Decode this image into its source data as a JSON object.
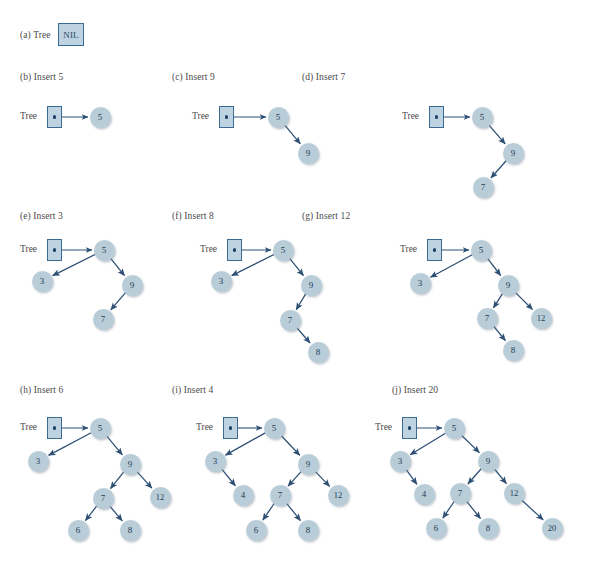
{
  "figure": {
    "node_fill": "#b9cdd9",
    "box_fill": "#bdd3e2",
    "border_color": "#3d6a91",
    "arrow_color": "#2d4f74",
    "text_color": "#243c52",
    "tree_pointer_label": "Tree",
    "nil_label": "NIL"
  },
  "panels": [
    {
      "id": "a",
      "label": "(a) Tree",
      "has_root_box": false,
      "has_nil": true,
      "nodes": [],
      "edges": []
    },
    {
      "id": "b",
      "label": "(b) Insert 5",
      "has_root_box": true,
      "has_nil": false,
      "nodes": [
        {
          "key": "5",
          "x": 100,
          "y": 117
        }
      ],
      "edges": [
        {
          "from": "root",
          "to": "5"
        }
      ]
    },
    {
      "id": "c",
      "label": "(c) Insert 9",
      "has_root_box": true,
      "has_nil": false,
      "nodes": [
        {
          "key": "5",
          "x": 278,
          "y": 117
        },
        {
          "key": "9",
          "x": 308,
          "y": 153
        }
      ],
      "edges": [
        {
          "from": "root",
          "to": "5"
        },
        {
          "from": "5",
          "to": "9"
        }
      ]
    },
    {
      "id": "d",
      "label": "(d) Insert 7",
      "has_root_box": true,
      "has_nil": false,
      "nodes": [
        {
          "key": "5",
          "x": 482,
          "y": 117
        },
        {
          "key": "9",
          "x": 513,
          "y": 153
        },
        {
          "key": "7",
          "x": 483,
          "y": 187
        }
      ],
      "edges": [
        {
          "from": "root",
          "to": "5"
        },
        {
          "from": "5",
          "to": "9"
        },
        {
          "from": "9",
          "to": "7"
        }
      ]
    },
    {
      "id": "e",
      "label": "(e) Insert 3",
      "has_root_box": true,
      "has_nil": false,
      "nodes": [
        {
          "key": "5",
          "x": 104,
          "y": 250
        },
        {
          "key": "3",
          "x": 42,
          "y": 281
        },
        {
          "key": "9",
          "x": 132,
          "y": 285
        },
        {
          "key": "7",
          "x": 103,
          "y": 319
        }
      ],
      "edges": [
        {
          "from": "root",
          "to": "5"
        },
        {
          "from": "5",
          "to": "3"
        },
        {
          "from": "5",
          "to": "9"
        },
        {
          "from": "9",
          "to": "7"
        }
      ]
    },
    {
      "id": "f",
      "label": "(f) Insert 8",
      "has_root_box": true,
      "has_nil": false,
      "nodes": [
        {
          "key": "5",
          "x": 283,
          "y": 250
        },
        {
          "key": "3",
          "x": 221,
          "y": 281
        },
        {
          "key": "9",
          "x": 311,
          "y": 285
        },
        {
          "key": "7",
          "x": 290,
          "y": 320
        },
        {
          "key": "8",
          "x": 318,
          "y": 352
        }
      ],
      "edges": [
        {
          "from": "root",
          "to": "5"
        },
        {
          "from": "5",
          "to": "3"
        },
        {
          "from": "5",
          "to": "9"
        },
        {
          "from": "9",
          "to": "7"
        },
        {
          "from": "7",
          "to": "8"
        }
      ]
    },
    {
      "id": "g",
      "label": "(g) Insert 12",
      "has_root_box": true,
      "has_nil": false,
      "nodes": [
        {
          "key": "5",
          "x": 481,
          "y": 250
        },
        {
          "key": "3",
          "x": 420,
          "y": 283
        },
        {
          "key": "9",
          "x": 508,
          "y": 285
        },
        {
          "key": "7",
          "x": 487,
          "y": 318
        },
        {
          "key": "12",
          "x": 541,
          "y": 318
        },
        {
          "key": "8",
          "x": 513,
          "y": 350
        }
      ],
      "edges": [
        {
          "from": "root",
          "to": "5"
        },
        {
          "from": "5",
          "to": "3"
        },
        {
          "from": "5",
          "to": "9"
        },
        {
          "from": "9",
          "to": "7"
        },
        {
          "from": "9",
          "to": "12"
        },
        {
          "from": "7",
          "to": "8"
        }
      ]
    },
    {
      "id": "h",
      "label": "(h) Insert 6",
      "has_root_box": true,
      "has_nil": false,
      "nodes": [
        {
          "key": "5",
          "x": 100,
          "y": 428
        },
        {
          "key": "3",
          "x": 38,
          "y": 461
        },
        {
          "key": "9",
          "x": 130,
          "y": 464
        },
        {
          "key": "7",
          "x": 103,
          "y": 498
        },
        {
          "key": "12",
          "x": 160,
          "y": 497
        },
        {
          "key": "6",
          "x": 78,
          "y": 530
        },
        {
          "key": "8",
          "x": 130,
          "y": 530
        }
      ],
      "edges": [
        {
          "from": "root",
          "to": "5"
        },
        {
          "from": "5",
          "to": "3"
        },
        {
          "from": "5",
          "to": "9"
        },
        {
          "from": "9",
          "to": "7"
        },
        {
          "from": "9",
          "to": "12"
        },
        {
          "from": "7",
          "to": "6"
        },
        {
          "from": "7",
          "to": "8"
        }
      ]
    },
    {
      "id": "i",
      "label": "(i) Insert 4",
      "has_root_box": true,
      "has_nil": false,
      "nodes": [
        {
          "key": "5",
          "x": 274,
          "y": 428
        },
        {
          "key": "3",
          "x": 215,
          "y": 461
        },
        {
          "key": "9",
          "x": 308,
          "y": 464
        },
        {
          "key": "4",
          "x": 243,
          "y": 495
        },
        {
          "key": "7",
          "x": 280,
          "y": 495
        },
        {
          "key": "12",
          "x": 338,
          "y": 495
        },
        {
          "key": "6",
          "x": 256,
          "y": 530
        },
        {
          "key": "8",
          "x": 308,
          "y": 530
        }
      ],
      "edges": [
        {
          "from": "root",
          "to": "5"
        },
        {
          "from": "5",
          "to": "3"
        },
        {
          "from": "5",
          "to": "9"
        },
        {
          "from": "3",
          "to": "4"
        },
        {
          "from": "9",
          "to": "7"
        },
        {
          "from": "9",
          "to": "12"
        },
        {
          "from": "7",
          "to": "6"
        },
        {
          "from": "7",
          "to": "8"
        }
      ]
    },
    {
      "id": "j",
      "label": "(j) Insert 20",
      "has_root_box": true,
      "has_nil": false,
      "nodes": [
        {
          "key": "5",
          "x": 454,
          "y": 428
        },
        {
          "key": "3",
          "x": 400,
          "y": 461
        },
        {
          "key": "9",
          "x": 488,
          "y": 461
        },
        {
          "key": "4",
          "x": 424,
          "y": 494
        },
        {
          "key": "7",
          "x": 460,
          "y": 493
        },
        {
          "key": "12",
          "x": 514,
          "y": 493
        },
        {
          "key": "6",
          "x": 436,
          "y": 528
        },
        {
          "key": "8",
          "x": 488,
          "y": 528
        },
        {
          "key": "20",
          "x": 552,
          "y": 528
        }
      ],
      "edges": [
        {
          "from": "root",
          "to": "5"
        },
        {
          "from": "5",
          "to": "3"
        },
        {
          "from": "5",
          "to": "9"
        },
        {
          "from": "3",
          "to": "4"
        },
        {
          "from": "9",
          "to": "7"
        },
        {
          "from": "9",
          "to": "12"
        },
        {
          "from": "7",
          "to": "6"
        },
        {
          "from": "7",
          "to": "8"
        },
        {
          "from": "12",
          "to": "20"
        }
      ]
    }
  ],
  "layout": {
    "labels": [
      {
        "id": "a",
        "x": 20,
        "y": 30
      },
      {
        "id": "b",
        "x": 20,
        "y": 72
      },
      {
        "id": "c",
        "x": 172,
        "y": 72
      },
      {
        "id": "d",
        "x": 302,
        "y": 72
      },
      {
        "id": "e",
        "x": 20,
        "y": 211
      },
      {
        "id": "f",
        "x": 172,
        "y": 211
      },
      {
        "id": "g",
        "x": 302,
        "y": 211
      },
      {
        "id": "h",
        "x": 20,
        "y": 385
      },
      {
        "id": "i",
        "x": 172,
        "y": 385
      },
      {
        "id": "j",
        "x": 392,
        "y": 385
      }
    ],
    "tree_words": [
      {
        "id": "b",
        "x": 20,
        "y": 117
      },
      {
        "id": "c",
        "x": 192,
        "y": 117
      },
      {
        "id": "d",
        "x": 402,
        "y": 117
      },
      {
        "id": "e",
        "x": 20,
        "y": 250
      },
      {
        "id": "f",
        "x": 200,
        "y": 250
      },
      {
        "id": "g",
        "x": 400,
        "y": 250
      },
      {
        "id": "h",
        "x": 20,
        "y": 428
      },
      {
        "id": "i",
        "x": 196,
        "y": 428
      },
      {
        "id": "j",
        "x": 375,
        "y": 428
      }
    ],
    "root_boxes": [
      {
        "id": "b",
        "x": 47,
        "y": 106
      },
      {
        "id": "c",
        "x": 219,
        "y": 106
      },
      {
        "id": "d",
        "x": 429,
        "y": 106
      },
      {
        "id": "e",
        "x": 47,
        "y": 239
      },
      {
        "id": "f",
        "x": 227,
        "y": 239
      },
      {
        "id": "g",
        "x": 427,
        "y": 239
      },
      {
        "id": "h",
        "x": 47,
        "y": 417
      },
      {
        "id": "i",
        "x": 223,
        "y": 417
      },
      {
        "id": "j",
        "x": 402,
        "y": 417
      }
    ],
    "nil_box": {
      "x": 58,
      "y": 23
    }
  }
}
